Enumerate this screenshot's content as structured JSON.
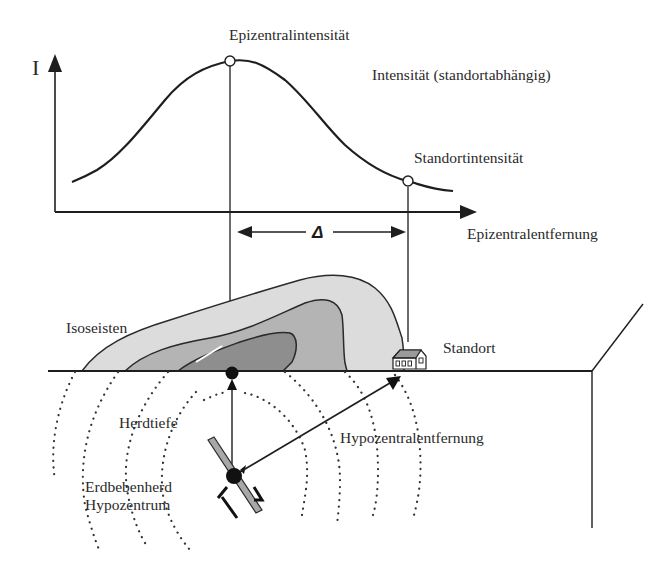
{
  "diagram": {
    "chart_section": {
      "y_axis_label": "I",
      "x_axis_label": "Epizentralentfernung",
      "curve_label": "Intensität  (standortabhängig)",
      "peak_label": "Epizentralintensität",
      "site_point_label": "Standortintensität",
      "distance_symbol": "Δ"
    },
    "cross_section": {
      "isoseismal_label": "Isoseisten",
      "site_label": "Standort",
      "depth_label": "Herdtiefe",
      "hypocentral_distance_label": "Hypozentralentfernung",
      "focus_label_line1": "Erdbebenherd",
      "focus_label_line2": "Hypozentrum"
    },
    "colors": {
      "line": "#1e1e1e",
      "zone_outer": "#dcdcdc",
      "zone_middle": "#b4b4b4",
      "zone_inner": "#8e8e8e",
      "fault": "#a8a8a8",
      "background": "#ffffff"
    }
  }
}
